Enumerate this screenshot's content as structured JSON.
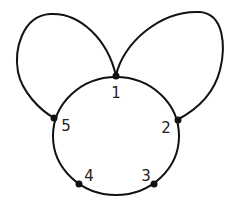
{
  "diagram": {
    "type": "graph",
    "nodes": [
      {
        "id": "1",
        "label": "1",
        "x": 116,
        "y": 76,
        "lx": 116,
        "ly": 98
      },
      {
        "id": "2",
        "label": "2",
        "x": 177,
        "y": 120,
        "lx": 166,
        "ly": 133
      },
      {
        "id": "3",
        "label": "3",
        "x": 154,
        "y": 184,
        "lx": 146,
        "ly": 181
      },
      {
        "id": "4",
        "label": "4",
        "x": 79,
        "y": 184,
        "lx": 89,
        "ly": 181
      },
      {
        "id": "5",
        "label": "5",
        "x": 54,
        "y": 118,
        "lx": 66,
        "ly": 131
      }
    ],
    "edges": [
      {
        "from": "1",
        "to": "2",
        "kind": "arc"
      },
      {
        "from": "2",
        "to": "3",
        "kind": "arc"
      },
      {
        "from": "3",
        "to": "4",
        "kind": "arc"
      },
      {
        "from": "4",
        "to": "5",
        "kind": "arc"
      },
      {
        "from": "5",
        "to": "1",
        "kind": "arc"
      },
      {
        "from": "1",
        "to": "5",
        "kind": "loop-left"
      },
      {
        "from": "1",
        "to": "2",
        "kind": "loop-right"
      }
    ],
    "colors": {
      "stroke": "#111111",
      "node": "#111111",
      "label": "#222222"
    }
  }
}
